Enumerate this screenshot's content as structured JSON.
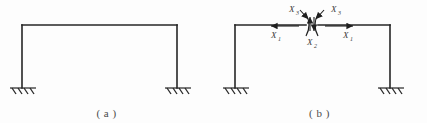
{
  "figure": {
    "background_color": "#fdfdfd",
    "line_color": "#262626",
    "label_color": "#3a3a3a",
    "panels": [
      {
        "id": "a",
        "caption": "( a )",
        "description": "portal frame with fixed supports",
        "geometry": {
          "left_column_x": 22,
          "right_column_x": 177,
          "beam_y": 25,
          "base_y": 88
        },
        "supports": [
          {
            "name": "left-fixed-support",
            "x": 22,
            "y": 88
          },
          {
            "name": "right-fixed-support",
            "x": 177,
            "y": 88
          }
        ],
        "forces": []
      },
      {
        "id": "b",
        "caption": "( b )",
        "description": "portal frame cut at beam midspan showing redundant force pairs",
        "geometry": {
          "left_column_x": 22,
          "right_column_x": 177,
          "beam_y": 25,
          "base_y": 88,
          "cut_x": 99
        },
        "supports": [
          {
            "name": "left-fixed-support",
            "x": 22,
            "y": 88
          },
          {
            "name": "right-fixed-support",
            "x": 177,
            "y": 88
          }
        ],
        "forces": [
          {
            "name": "moment-left",
            "symbol": "X",
            "subscript": "3",
            "position": "top-left",
            "type": "moment"
          },
          {
            "name": "moment-right",
            "symbol": "X",
            "subscript": "3",
            "position": "top-right",
            "type": "moment"
          },
          {
            "name": "shear-pair",
            "symbol": "X",
            "subscript": "2",
            "position": "bottom-center",
            "type": "vertical"
          },
          {
            "name": "axial-left",
            "symbol": "X",
            "subscript": "1",
            "position": "mid-left",
            "type": "horizontal"
          },
          {
            "name": "axial-right",
            "symbol": "X",
            "subscript": "1",
            "position": "mid-right",
            "type": "horizontal"
          }
        ]
      }
    ]
  }
}
